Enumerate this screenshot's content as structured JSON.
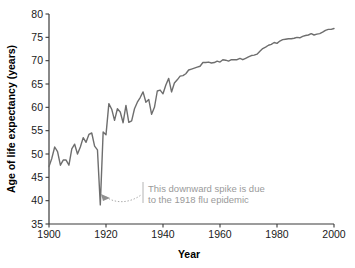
{
  "chart_data": {
    "type": "line",
    "title": "",
    "xlabel": "Year",
    "ylabel": "Age of life expectancy (years)",
    "xlim": [
      1900,
      2000
    ],
    "ylim": [
      35,
      80
    ],
    "xticks": [
      1900,
      1920,
      1940,
      1960,
      1980,
      2000
    ],
    "yticks": [
      35,
      40,
      45,
      50,
      55,
      60,
      65,
      70,
      75,
      80
    ],
    "grid": false,
    "legend": null,
    "line_color": "#6e6e6e",
    "annotations": [
      {
        "name": "flu-epidemic-note",
        "text_line1": "This downward spike is due",
        "text_line2": "to the 1918 flu epidemic",
        "points_to_year": 1918,
        "points_to_value": 39.1
      }
    ],
    "series": [
      {
        "name": "US life expectancy at birth",
        "x": [
          1900,
          1901,
          1902,
          1903,
          1904,
          1905,
          1906,
          1907,
          1908,
          1909,
          1910,
          1911,
          1912,
          1913,
          1914,
          1915,
          1916,
          1917,
          1918,
          1919,
          1920,
          1921,
          1922,
          1923,
          1924,
          1925,
          1926,
          1927,
          1928,
          1929,
          1930,
          1931,
          1932,
          1933,
          1934,
          1935,
          1936,
          1937,
          1938,
          1939,
          1940,
          1941,
          1942,
          1943,
          1944,
          1945,
          1946,
          1947,
          1948,
          1949,
          1950,
          1951,
          1952,
          1953,
          1954,
          1955,
          1956,
          1957,
          1958,
          1959,
          1960,
          1961,
          1962,
          1963,
          1964,
          1965,
          1966,
          1967,
          1968,
          1969,
          1970,
          1971,
          1972,
          1973,
          1974,
          1975,
          1976,
          1977,
          1978,
          1979,
          1980,
          1981,
          1982,
          1983,
          1984,
          1985,
          1986,
          1987,
          1988,
          1989,
          1990,
          1991,
          1992,
          1993,
          1994,
          1995,
          1996,
          1997,
          1998,
          1999,
          2000
        ],
        "y": [
          47.3,
          49.1,
          51.5,
          50.5,
          47.6,
          48.7,
          48.7,
          47.6,
          51.1,
          52.1,
          50.0,
          51.5,
          53.5,
          52.5,
          54.2,
          54.5,
          51.7,
          50.9,
          39.1,
          54.7,
          54.1,
          60.8,
          59.6,
          57.2,
          59.7,
          59.0,
          56.7,
          60.4,
          56.8,
          57.1,
          59.7,
          61.1,
          62.1,
          63.3,
          61.1,
          61.7,
          58.5,
          60.0,
          63.5,
          63.7,
          62.9,
          64.8,
          66.2,
          63.3,
          65.2,
          65.9,
          66.7,
          66.8,
          67.2,
          68.0,
          68.2,
          68.4,
          68.6,
          68.8,
          69.6,
          69.6,
          69.7,
          69.5,
          69.6,
          69.9,
          69.7,
          70.2,
          70.1,
          69.9,
          70.2,
          70.2,
          70.2,
          70.5,
          70.2,
          70.5,
          70.8,
          71.1,
          71.2,
          71.4,
          72.0,
          72.6,
          72.9,
          73.3,
          73.5,
          73.9,
          73.7,
          74.2,
          74.5,
          74.6,
          74.7,
          74.7,
          74.8,
          75.0,
          74.9,
          75.2,
          75.4,
          75.5,
          75.8,
          75.5,
          75.7,
          75.8,
          76.1,
          76.5,
          76.7,
          76.7,
          76.9
        ]
      }
    ]
  },
  "axis": {
    "x_tick_labels": [
      "1900",
      "1920",
      "1940",
      "1960",
      "1980",
      "2000"
    ],
    "y_tick_labels": [
      "35",
      "40",
      "45",
      "50",
      "55",
      "60",
      "65",
      "70",
      "75",
      "80"
    ],
    "x_title": "Year",
    "y_title": "Age of life expectancy (years)"
  },
  "annotation": {
    "line1": "This downward spike is due",
    "line2": "to the 1918 flu epidemic"
  }
}
